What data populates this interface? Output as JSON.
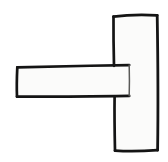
{
  "image": {
    "title": "Hand-drawn sideways T shape",
    "description": "Two overlapping rectangles forming a rotated T: a tall vertical bar on the right and a wide horizontal bar extending to the left from its middle.",
    "width": 168,
    "height": 162,
    "background_color": "#ffffff",
    "shape_fill_color": "#fbfbfa",
    "stroke_color": "#141414",
    "overlap_stroke_color": "#5a5a58",
    "stroke_width": 2.6,
    "overlap_stroke_width": 1.4,
    "style": "hand-drawn ink line art, no text labels"
  },
  "shapes": [
    {
      "name": "vertical-bar",
      "type": "rectangle",
      "orientation": "vertical",
      "points": "114,16 157,15 158,150 115,151",
      "bounds": {
        "x": 114,
        "y": 15,
        "width": 44,
        "height": 136
      }
    },
    {
      "name": "horizontal-bar",
      "type": "rectangle",
      "orientation": "horizontal",
      "points": "17,67 129,65 129,96 17,97",
      "bounds": {
        "x": 17,
        "y": 65,
        "width": 112,
        "height": 32
      }
    }
  ],
  "overlap": {
    "name": "horizontal-bar-right-edge",
    "description": "Right edge of the horizontal bar drawn faintly inside the vertical bar",
    "points": "129,65 129,96"
  },
  "junction": {
    "name": "vertical-bar-left-edge-gap",
    "description": "Left edge of vertical bar is interrupted where the horizontal bar crosses it",
    "upper_segment": "114,16 114,66",
    "lower_segment": "115,96 115,151"
  }
}
